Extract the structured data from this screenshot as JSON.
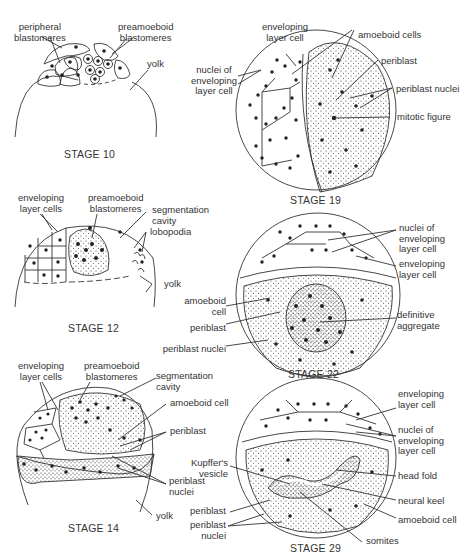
{
  "figure": {
    "stages": [
      {
        "id": "stage10",
        "title": "STAGE 10",
        "labels": [
          "peripheral\nblastomeres",
          "preamoeboid\nblastomeres",
          "yolk"
        ]
      },
      {
        "id": "stage19",
        "title": "STAGE 19",
        "labels": [
          "enveloping\nlayer cell",
          "nuclei of\nenveloping\nlayer cell",
          "amoeboid cells",
          "periblast",
          "periblast nuclei",
          "mitotic figure"
        ]
      },
      {
        "id": "stage12",
        "title": "STAGE 12",
        "labels": [
          "enveloping\nlayer cells",
          "preamoeboid\nblastomeres",
          "segmentation\ncavity",
          "lobopodia",
          "yolk"
        ]
      },
      {
        "id": "stage22",
        "title": "STAGE 22",
        "labels": [
          "nuclei of\nenveloping\nlayer cell",
          "enveloping\nlayer cell",
          "amoeboid\ncell",
          "periblast",
          "periblast nuclei",
          "definitive\naggregate"
        ]
      },
      {
        "id": "stage14",
        "title": "STAGE 14",
        "labels": [
          "enveloping\nlayer cells",
          "preamoeboid\nblastomeres",
          "segmentation\ncavity",
          "amoeboid cell",
          "periblast",
          "periblast\nnuclei",
          "yolk"
        ]
      },
      {
        "id": "stage29",
        "title": "STAGE 29",
        "labels": [
          "enveloping\nlayer cell",
          "nuclei of\nenveloping\nlayer cell",
          "Kupffer's\nvesicle",
          "head fold",
          "neural keel",
          "periblast",
          "periblast\nnuclei",
          "amoeboid cell",
          "somites"
        ]
      }
    ]
  }
}
